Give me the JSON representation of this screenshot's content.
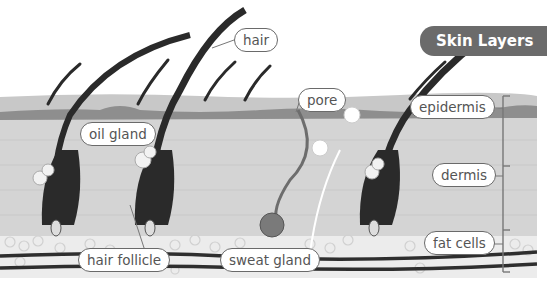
{
  "title": "Skin Layers",
  "labels": {
    "hair": "hair",
    "pore": "pore",
    "oil_gland": "oil gland",
    "hair_follicle": "hair follicle",
    "sweat_gland": "sweat gland",
    "epidermis": "epidermis",
    "dermis": "dermis",
    "fat_cells": "fat cells"
  },
  "colors": {
    "title_bg": "#6b6b6b",
    "epidermis": "#c9c9c9",
    "epidermis_dark": "#8f8f8f",
    "dermis": "#d6d6d6",
    "fat": "#ececec",
    "hair": "#2a2a2a",
    "vessel": "#2e2e2e"
  }
}
